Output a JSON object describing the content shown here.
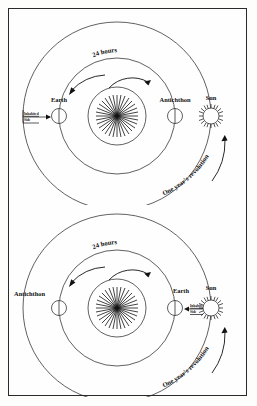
{
  "figure": {
    "title_visible": false,
    "border_color": "#2a2a2a",
    "background_color": "#fefefe",
    "ink_color": "#111111"
  },
  "diagrams": [
    {
      "id": "top",
      "name": "philolaus-cosmology-position-1",
      "central_fire": {
        "label": "",
        "icon": "starburst-icon"
      },
      "bodies": [
        {
          "name": "earth",
          "label": "Earth",
          "side": "left"
        },
        {
          "name": "antichthon",
          "label": "Antichthon",
          "side": "right"
        },
        {
          "name": "sun",
          "label": "Sun",
          "side": "far-right"
        }
      ],
      "annotations": {
        "inhabited_side": "Inhabited\nSide",
        "inhabited_side_line1": "Inhabited",
        "inhabited_side_line2": "Side",
        "rotation": "24 hours",
        "revolution": "One year's revolution"
      }
    },
    {
      "id": "bottom",
      "name": "philolaus-cosmology-position-2",
      "central_fire": {
        "label": "",
        "icon": "starburst-icon"
      },
      "bodies": [
        {
          "name": "antichthon",
          "label": "Antichthon",
          "side": "left"
        },
        {
          "name": "earth",
          "label": "Earth",
          "side": "right"
        },
        {
          "name": "sun",
          "label": "Sun",
          "side": "far-right"
        }
      ],
      "annotations": {
        "inhabited_side": "Inhabited\nSide",
        "inhabited_side_line1": "Inhabited",
        "inhabited_side_line2": "Side",
        "rotation": "24 hours",
        "revolution": "One year's revolution"
      }
    }
  ]
}
